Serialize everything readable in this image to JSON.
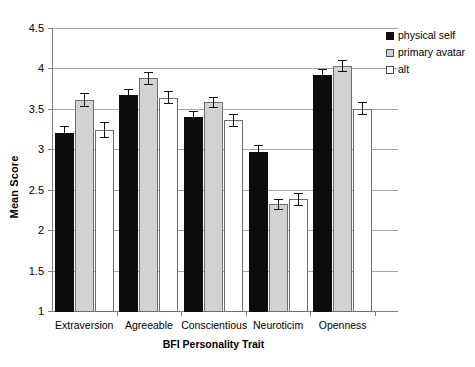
{
  "chart_data": {
    "type": "bar",
    "title": "",
    "xlabel": "BFI Personality Trait",
    "ylabel": "Mean Score",
    "categories": [
      "Extraversion",
      "Agreeable",
      "Conscientious",
      "Neuroticim",
      "Openness"
    ],
    "ylim": [
      1,
      4.5
    ],
    "yticks": [
      "1",
      "1.5",
      "2",
      "2.5",
      "3",
      "3.5",
      "4",
      "4.5"
    ],
    "ytick_values": [
      1,
      1.5,
      2,
      2.5,
      3,
      3.5,
      4,
      4.5
    ],
    "grid": true,
    "legend_position": "top-right",
    "series": [
      {
        "name": "physical self",
        "color": "#0d0d0d",
        "values": [
          3.2,
          3.67,
          3.4,
          2.97,
          3.92
        ],
        "errors": [
          0.09,
          0.08,
          0.07,
          0.08,
          0.07
        ]
      },
      {
        "name": "primary avatar",
        "color": "#d2d2d2",
        "values": [
          3.61,
          3.88,
          3.58,
          2.32,
          4.03
        ],
        "errors": [
          0.09,
          0.08,
          0.07,
          0.07,
          0.07
        ]
      },
      {
        "name": "alt",
        "color": "#ffffff",
        "values": [
          3.24,
          3.64,
          3.36,
          2.38,
          3.5
        ],
        "errors": [
          0.1,
          0.08,
          0.08,
          0.08,
          0.08
        ]
      }
    ]
  }
}
